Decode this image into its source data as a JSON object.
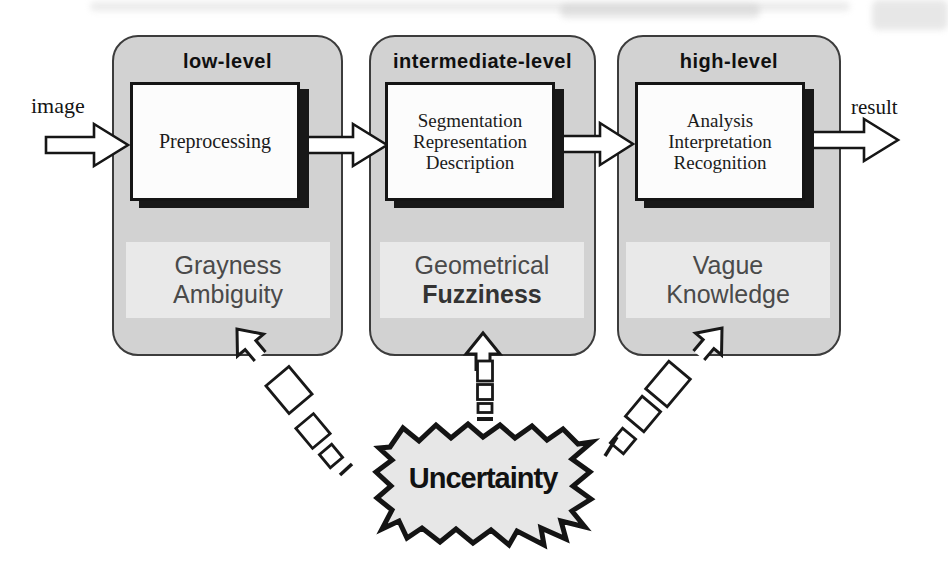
{
  "diagram": {
    "title_note": "image processing levels with uncertainty",
    "input_label": "image",
    "output_label": "result",
    "uncertainty_label": "Uncertainty",
    "stages": [
      {
        "level": "low-level",
        "process": [
          "Preprocessing"
        ],
        "issue": [
          "Grayness",
          "Ambiguity"
        ]
      },
      {
        "level": "intermediate-level",
        "process": [
          "Segmentation",
          "Representation",
          "Description"
        ],
        "issue": [
          "Geometrical",
          "Fuzziness"
        ]
      },
      {
        "level": "high-level",
        "process": [
          "Analysis",
          "Interpretation",
          "Recognition"
        ],
        "issue": [
          "Vague",
          "Knowledge"
        ]
      }
    ],
    "colors": {
      "panel_fill": "#d2d2d2",
      "issue_box_fill": "#e9e9e9",
      "process_box_fill": "#fcfcfc",
      "burst_fill": "#e7e7e7",
      "ink": "#1a1a1a",
      "issue_text": "#4a4a4a"
    }
  }
}
